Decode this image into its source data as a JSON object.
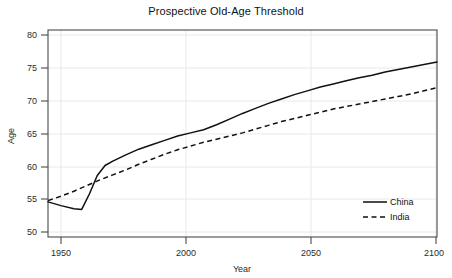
{
  "chart_data": {
    "type": "line",
    "title": "Prospective Old-Age Threshold",
    "xlabel": "Year",
    "ylabel": "Age",
    "xlim": [
      1950,
      2100
    ],
    "ylim": [
      48.5,
      81.5
    ],
    "xticks": [
      1950,
      2000,
      2050,
      2100
    ],
    "yticks": [
      50,
      55,
      60,
      65,
      70,
      75,
      80
    ],
    "grid": true,
    "legend_position": "bottom-right",
    "series": [
      {
        "name": "China",
        "style": "solid",
        "color": "#111111",
        "x": [
          1950,
          1955,
          1960,
          1963,
          1966,
          1969,
          1972,
          1975,
          1980,
          1985,
          1990,
          1995,
          2000,
          2005,
          2010,
          2015,
          2020,
          2025,
          2030,
          2035,
          2040,
          2045,
          2050,
          2055,
          2060,
          2065,
          2070,
          2075,
          2080,
          2085,
          2090,
          2095,
          2100
        ],
        "y": [
          54.1,
          53.5,
          53.0,
          52.9,
          55.4,
          58.3,
          59.9,
          60.6,
          61.6,
          62.5,
          63.2,
          63.9,
          64.6,
          65.1,
          65.6,
          66.4,
          67.3,
          68.2,
          69.0,
          69.8,
          70.5,
          71.2,
          71.8,
          72.4,
          72.9,
          73.4,
          73.9,
          74.3,
          74.8,
          75.2,
          75.6,
          76.0,
          76.4
        ]
      },
      {
        "name": "India",
        "style": "dashed",
        "color": "#111111",
        "x": [
          1950,
          1955,
          1960,
          1965,
          1970,
          1975,
          1980,
          1985,
          1990,
          1995,
          2000,
          2005,
          2010,
          2015,
          2020,
          2025,
          2030,
          2035,
          2040,
          2045,
          2050,
          2055,
          2060,
          2065,
          2070,
          2075,
          2080,
          2085,
          2090,
          2095,
          2100
        ],
        "y": [
          54.3,
          55.0,
          55.8,
          56.7,
          57.6,
          58.4,
          59.2,
          60.1,
          60.9,
          61.7,
          62.4,
          63.0,
          63.6,
          64.1,
          64.6,
          65.1,
          65.7,
          66.3,
          66.9,
          67.4,
          67.9,
          68.4,
          68.9,
          69.3,
          69.7,
          70.1,
          70.5,
          70.9,
          71.3,
          71.8,
          72.3
        ]
      }
    ]
  },
  "legend": {
    "items": [
      {
        "label": "China"
      },
      {
        "label": "India"
      }
    ]
  },
  "axis": {
    "x_tick_labels": [
      "1950",
      "2000",
      "2050",
      "2100"
    ],
    "y_tick_labels": [
      "50",
      "55",
      "60",
      "65",
      "70",
      "75",
      "80"
    ]
  }
}
